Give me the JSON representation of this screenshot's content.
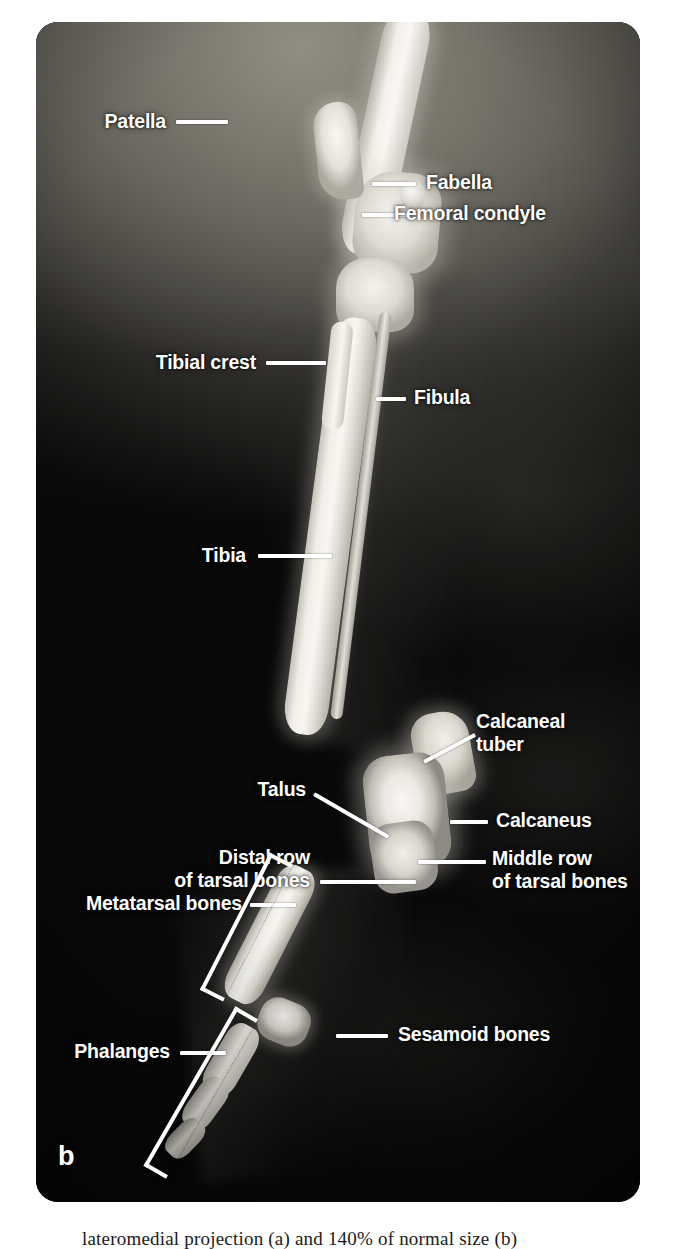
{
  "figure": {
    "panel_letter": "b",
    "modality": "radiograph",
    "caption": "lateromedial projection (a) and 140% of normal size (b)",
    "colors": {
      "label_text": "#ffffff",
      "leader_line": "#ffffff",
      "background_dark": "#060606",
      "soft_tissue_grey": "#7a7871",
      "bone_white": "#f4f2ec",
      "caption_text": "#1a1a1a"
    }
  },
  "labels": [
    {
      "id": "patella",
      "text": "Patella"
    },
    {
      "id": "fabella",
      "text": "Fabella"
    },
    {
      "id": "femoral-condyle",
      "text": "Femoral condyle"
    },
    {
      "id": "tibial-crest",
      "text": "Tibial crest"
    },
    {
      "id": "fibula",
      "text": "Fibula"
    },
    {
      "id": "tibia",
      "text": "Tibia"
    },
    {
      "id": "calcaneal-tuber",
      "text": "Calcaneal"
    },
    {
      "id": "calcaneal-tuber-2",
      "text": "tuber"
    },
    {
      "id": "talus",
      "text": "Talus"
    },
    {
      "id": "calcaneus",
      "text": "Calcaneus"
    },
    {
      "id": "distal-row-1",
      "text": "Distal row"
    },
    {
      "id": "distal-row-2",
      "text": "of tarsal bones"
    },
    {
      "id": "middle-row-1",
      "text": "Middle row"
    },
    {
      "id": "middle-row-2",
      "text": "of tarsal bones"
    },
    {
      "id": "metatarsal-bones",
      "text": "Metatarsal bones"
    },
    {
      "id": "sesamoid-bones",
      "text": "Sesamoid bones"
    },
    {
      "id": "phalanges",
      "text": "Phalanges"
    }
  ]
}
